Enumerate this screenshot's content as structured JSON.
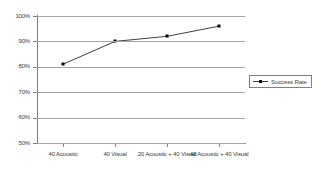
{
  "chart_data": {
    "type": "line",
    "title": "",
    "xlabel": "",
    "ylabel": "",
    "categories": [
      "40 Acoustic",
      "40 Visual",
      "20 Acoustic + 40 Visual",
      "40 Acoustic + 40 Visual"
    ],
    "series": [
      {
        "name": "Success Rate",
        "values": [
          81,
          90,
          92,
          96
        ]
      }
    ],
    "ylim": [
      50,
      100
    ],
    "yticks": [
      100,
      90,
      80,
      70,
      60,
      50
    ],
    "ytick_labels": [
      "100%",
      "90%",
      "80%",
      "70%",
      "60%",
      "50%"
    ],
    "grid": true,
    "legend_position": "right",
    "colors": {
      "line": "#404040",
      "marker": "#000000",
      "grid": "#a6a6a6",
      "axis": "#808080",
      "text": "#3c3c3c",
      "background": "#ffffff"
    }
  },
  "legend": {
    "entries": [
      {
        "label": "Success Rate"
      }
    ]
  }
}
